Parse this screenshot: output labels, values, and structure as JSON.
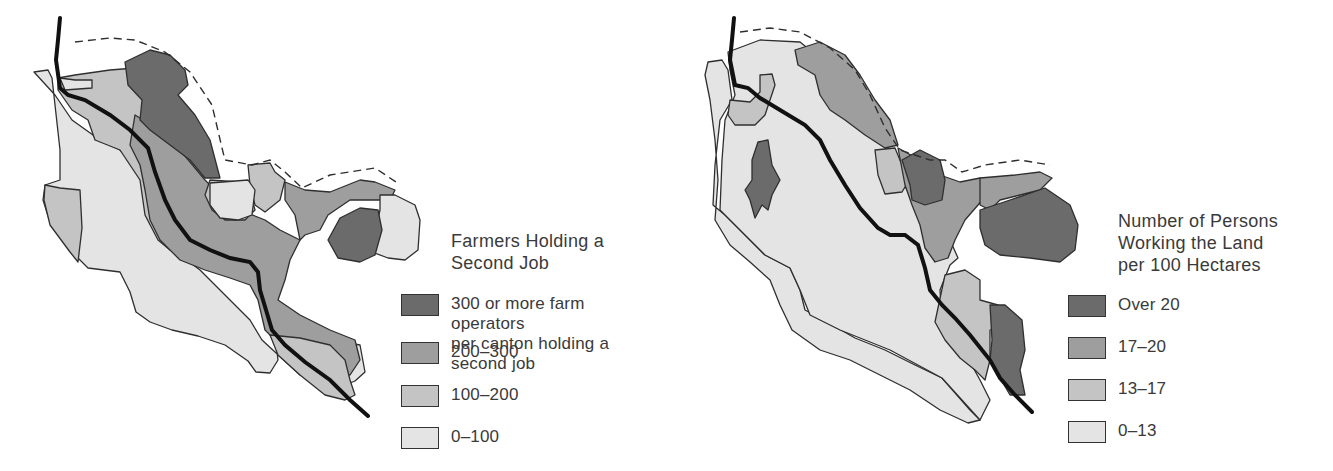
{
  "colors": {
    "darkest": "#6b6b6b",
    "dark": "#9e9e9e",
    "medium": "#c4c4c4",
    "light": "#e4e4e4",
    "outline": "#2f2f2f",
    "river": "#111111"
  },
  "maps": [
    {
      "id": "left",
      "legend": {
        "title_lines": [
          "Farmers Holding a",
          "Second Job"
        ],
        "items": [
          {
            "label_lines": [
              "300 or more farm operators",
              "per canton holding a second job"
            ],
            "color": "#6b6b6b"
          },
          {
            "label_lines": [
              "200–300"
            ],
            "color": "#9e9e9e"
          },
          {
            "label_lines": [
              "100–200"
            ],
            "color": "#c4c4c4"
          },
          {
            "label_lines": [
              "0–100"
            ],
            "color": "#e4e4e4"
          }
        ]
      }
    },
    {
      "id": "right",
      "legend": {
        "title_lines": [
          "Number of Persons",
          "Working the Land",
          "per 100 Hectares"
        ],
        "items": [
          {
            "label_lines": [
              "Over 20"
            ],
            "color": "#6b6b6b"
          },
          {
            "label_lines": [
              "17–20"
            ],
            "color": "#9e9e9e"
          },
          {
            "label_lines": [
              "13–17"
            ],
            "color": "#c4c4c4"
          },
          {
            "label_lines": [
              "0–13"
            ],
            "color": "#e4e4e4"
          }
        ]
      }
    }
  ]
}
